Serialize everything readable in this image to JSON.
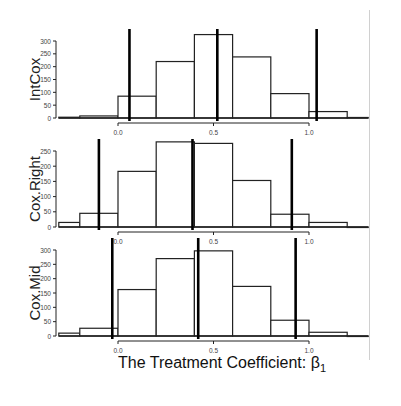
{
  "chart_data": [
    {
      "type": "bar",
      "title": "",
      "ylabel": "IntCox",
      "xlabel": "",
      "bin_edges": [
        -0.31,
        -0.2,
        0.0,
        0.2,
        0.4,
        0.6,
        0.8,
        1.0,
        1.2,
        1.31
      ],
      "values": [
        3,
        8,
        85,
        220,
        325,
        238,
        95,
        25,
        2
      ],
      "yticks": [
        "0",
        "50",
        "100",
        "150",
        "200",
        "250",
        "300"
      ],
      "ylim": [
        0,
        300
      ],
      "xticks": [
        "0.0",
        "0.5",
        "1.0"
      ],
      "vlines": [
        0.06,
        0.52,
        1.04
      ]
    },
    {
      "type": "bar",
      "title": "",
      "ylabel": "Cox.Right",
      "xlabel": "",
      "bin_edges": [
        -0.31,
        -0.2,
        0.0,
        0.2,
        0.4,
        0.6,
        0.8,
        1.0,
        1.2,
        1.31
      ],
      "values": [
        15,
        45,
        183,
        280,
        275,
        153,
        42,
        15,
        0
      ],
      "yticks": [
        "0",
        "50",
        "100",
        "150",
        "200",
        "250"
      ],
      "ylim": [
        0,
        250
      ],
      "xticks": [
        "0.0",
        "0.5",
        "1.0"
      ],
      "vlines": [
        -0.1,
        0.39,
        0.91
      ]
    },
    {
      "type": "bar",
      "title": "",
      "ylabel": "Cox.Mid",
      "xlabel": "The Treatment Coefficient: β1",
      "bin_edges": [
        -0.31,
        -0.2,
        0.0,
        0.2,
        0.4,
        0.6,
        0.8,
        1.0,
        1.2,
        1.31
      ],
      "values": [
        10,
        27,
        162,
        270,
        297,
        173,
        55,
        13,
        0
      ],
      "yticks": [
        "0",
        "50",
        "100",
        "150",
        "200",
        "250",
        "300"
      ],
      "ylim": [
        0,
        300
      ],
      "xticks": [
        "0.0",
        "0.5",
        "1.0"
      ],
      "vlines": [
        -0.03,
        0.42,
        0.93
      ]
    }
  ],
  "xaxis_title_main": "The Treatment Coefficient: β",
  "xaxis_title_sub": "1"
}
